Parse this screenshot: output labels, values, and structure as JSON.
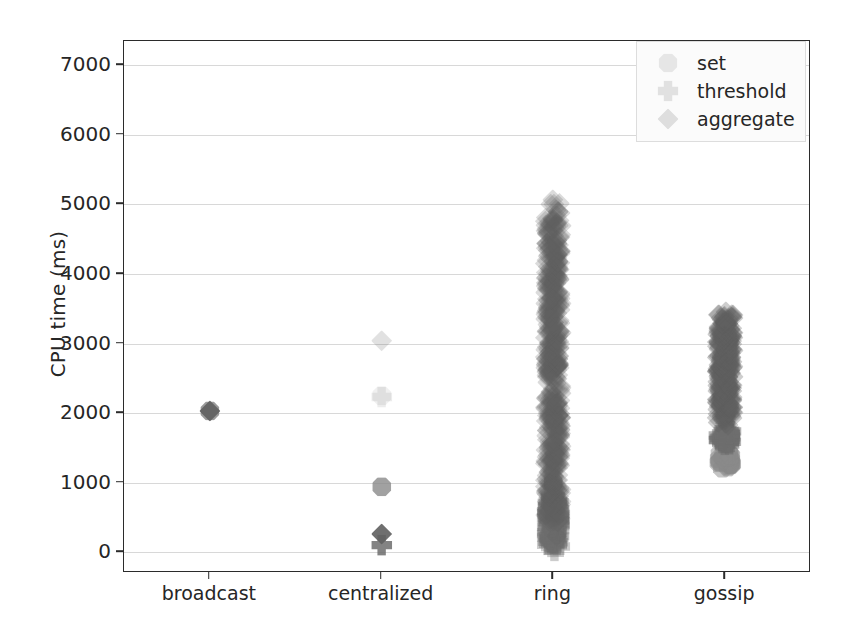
{
  "chart_data": {
    "type": "scatter",
    "title": "",
    "xlabel": "",
    "ylabel": "CPU time (ms)",
    "categories": [
      "broadcast",
      "centralized",
      "ring",
      "gossip"
    ],
    "yticks": [
      0,
      1000,
      2000,
      3000,
      4000,
      5000,
      6000,
      7000
    ],
    "ylim": [
      -300,
      7350
    ],
    "grid": "y-only",
    "legend_position": "upper right",
    "legend": [
      "set",
      "threshold",
      "aggregate"
    ],
    "series": [
      {
        "name": "set",
        "marker": "octagon",
        "color": "#8a8a8a",
        "points": [
          {
            "category": "broadcast",
            "value": 2030,
            "count": 1,
            "spread": 0,
            "opacity": 0.85
          },
          {
            "category": "centralized",
            "value": 2250,
            "count": 1,
            "spread": 0,
            "opacity": 0.12
          },
          {
            "category": "centralized",
            "value": 940,
            "count": 1,
            "spread": 0,
            "opacity": 0.8
          },
          {
            "category": "ring",
            "value": 1000,
            "count": 1,
            "spread": 0,
            "opacity": 0.8
          },
          {
            "category": "gossip",
            "value": 1320,
            "count": 30,
            "spread": 110,
            "opacity": 0.5
          }
        ]
      },
      {
        "name": "threshold",
        "marker": "x",
        "color": "#6e6e6e",
        "points": [
          {
            "category": "centralized",
            "value": 2230,
            "count": 1,
            "spread": 0,
            "opacity": 0.12
          },
          {
            "category": "centralized",
            "value": 100,
            "count": 1,
            "spread": 0,
            "opacity": 0.85
          },
          {
            "category": "ring",
            "value": 420,
            "count": 160,
            "spread": 380,
            "opacity": 0.35
          },
          {
            "category": "gossip",
            "value": 1650,
            "count": 40,
            "spread": 110,
            "opacity": 0.5
          }
        ]
      },
      {
        "name": "aggregate",
        "marker": "diamond",
        "color": "#606060",
        "points": [
          {
            "category": "broadcast",
            "value": 2030,
            "count": 1,
            "spread": 0,
            "opacity": 0.9
          },
          {
            "category": "centralized",
            "value": 3040,
            "count": 1,
            "spread": 0,
            "opacity": 0.18
          },
          {
            "category": "centralized",
            "value": 260,
            "count": 1,
            "spread": 0,
            "opacity": 0.9
          },
          {
            "category": "ring",
            "value": 2700,
            "count": 520,
            "spread": 2350,
            "opacity": 0.22
          },
          {
            "category": "gossip",
            "value": 2650,
            "count": 300,
            "spread": 800,
            "opacity": 0.3
          }
        ]
      }
    ],
    "notes": {
      "broadcast_set_value": 2030,
      "broadcast_aggregate_value": 2030,
      "centralized_set_value": 940,
      "centralized_threshold_value": 100,
      "centralized_aggregate_value": 260,
      "centralized_faint_set_value": 2250,
      "centralized_faint_threshold_value": 2230,
      "centralized_faint_aggregate_value": 3040,
      "ring_set_value": 1000,
      "ring_threshold_range": [
        40,
        800
      ],
      "ring_aggregate_range": [
        400,
        7100
      ],
      "gossip_set_range": [
        1200,
        1450
      ],
      "gossip_threshold_range": [
        1520,
        1780
      ],
      "gossip_aggregate_range": [
        1900,
        4050
      ]
    }
  }
}
